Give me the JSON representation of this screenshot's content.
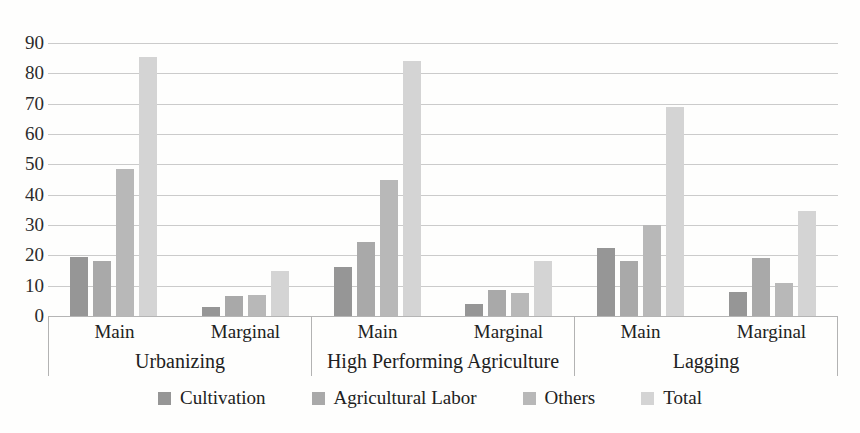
{
  "chart_data": {
    "type": "bar",
    "title": "",
    "xlabel": "",
    "ylabel": "",
    "grid": true,
    "y_axis": {
      "min": 0,
      "max": 90,
      "step": 10,
      "tick_labels": [
        "0",
        "10",
        "20",
        "30",
        "40",
        "50",
        "60",
        "70",
        "80",
        "90"
      ]
    },
    "x_axis": {
      "groups": [
        {
          "label": "Urbanizing",
          "subcategories": [
            "Main",
            "Marginal"
          ]
        },
        {
          "label": "High Performing Agriculture",
          "subcategories": [
            "Main",
            "Marginal"
          ]
        },
        {
          "label": "Lagging",
          "subcategories": [
            "Main",
            "Marginal"
          ]
        }
      ]
    },
    "categories": [
      "Urbanizing Main",
      "Urbanizing Marginal",
      "High Performing Agriculture Main",
      "High Performing Agriculture Marginal",
      "Lagging Main",
      "Lagging Marginal"
    ],
    "series": [
      {
        "name": "Cultivation",
        "color": "#969696",
        "values": [
          19.5,
          3,
          16,
          4,
          22.5,
          8
        ]
      },
      {
        "name": "Agricultural Labor",
        "color": "#a9a9a9",
        "values": [
          18,
          6.5,
          24.5,
          8.5,
          18,
          19
        ]
      },
      {
        "name": "Others",
        "color": "#b8b8b8",
        "values": [
          48.5,
          7,
          45,
          7.5,
          30,
          11
        ]
      },
      {
        "name": "Total",
        "color": "#d4d4d4",
        "values": [
          85.5,
          15,
          84,
          18,
          69,
          34.5
        ]
      }
    ],
    "legend": {
      "position": "bottom",
      "entries": [
        "Cultivation",
        "Agricultural Labor",
        "Others",
        "Total"
      ]
    }
  },
  "style": {
    "gridline_color": "#cbcbcb",
    "baseline_color": "#b5b5b5",
    "table_border_color": "#b3b3b3",
    "text_color": "#212121",
    "background": "#fefefd"
  }
}
